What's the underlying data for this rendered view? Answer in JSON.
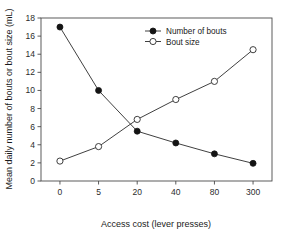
{
  "chart_data": {
    "type": "line",
    "title": "",
    "xlabel": "Access cost (lever presses)",
    "ylabel": "Mean daily number of bouts or bout size (mL)",
    "categories": [
      "0",
      "5",
      "20",
      "40",
      "80",
      "300"
    ],
    "xtick_labels": [
      "0",
      "5",
      "20",
      "40",
      "80",
      "300"
    ],
    "ytick_labels": [
      "0",
      "2",
      "4",
      "6",
      "8",
      "10",
      "12",
      "14",
      "16",
      "18"
    ],
    "ylim": [
      0,
      18
    ],
    "ytick_step": 2,
    "grid": false,
    "legend_position": "top-center-right",
    "series": [
      {
        "name": "Number of bouts",
        "marker": "filled-circle",
        "values": [
          17.0,
          10.0,
          5.5,
          4.2,
          3.0,
          1.95
        ]
      },
      {
        "name": "Bout size",
        "marker": "open-circle",
        "values": [
          2.2,
          3.8,
          6.8,
          9.0,
          11.0,
          14.5
        ]
      }
    ]
  },
  "legend": {
    "entries": [
      {
        "label": "Number of bouts"
      },
      {
        "label": "Bout size"
      }
    ]
  },
  "colors": {
    "line": "#2a2a2a",
    "filled_marker": "#141414",
    "open_marker_fill": "#ffffff",
    "axis": "#4a4a4a",
    "background": "#ffffff"
  }
}
